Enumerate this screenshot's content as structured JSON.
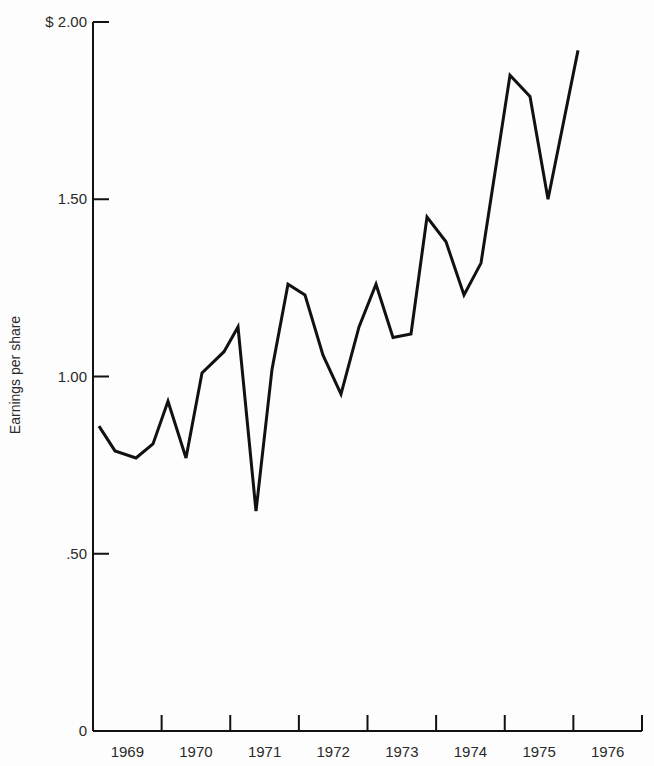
{
  "chart_data": {
    "type": "line",
    "title": "",
    "xlabel": "",
    "ylabel": "Earnings per share",
    "ylim": [
      0,
      2.0
    ],
    "y_ticks": [
      {
        "value": 0,
        "label": "0"
      },
      {
        "value": 0.5,
        "label": ".50"
      },
      {
        "value": 1.0,
        "label": "1.00"
      },
      {
        "value": 1.5,
        "label": "1.50"
      },
      {
        "value": 2.0,
        "label": "$ 2.00"
      }
    ],
    "x_ticks": [
      "1969",
      "1970",
      "1971",
      "1972",
      "1973",
      "1974",
      "1975",
      "1976"
    ],
    "grid": false,
    "legend": null,
    "series": [
      {
        "name": "Earnings per share (quarterly)",
        "x": [
          "1969 Q1",
          "1969 Q2",
          "1969 Q3",
          "1969 Q4",
          "1970 Q1",
          "1970 Q2",
          "1970 Q3",
          "1970 Q4",
          "1971 Q1",
          "1971 Q2",
          "1971 Q3",
          "1971 Q4",
          "1972 Q1",
          "1972 Q2",
          "1972 Q3",
          "1972 Q4",
          "1973 Q1",
          "1973 Q2",
          "1973 Q3",
          "1973 Q4",
          "1974 Q1",
          "1974 Q2",
          "1974 Q3",
          "1974 Q4",
          "1975 Q1",
          "1975 Q2",
          "1975 Q3"
        ],
        "values": [
          0.86,
          0.79,
          0.77,
          0.81,
          0.93,
          0.77,
          1.01,
          1.07,
          1.14,
          0.62,
          1.02,
          1.26,
          1.23,
          1.06,
          0.95,
          1.14,
          1.26,
          1.11,
          1.12,
          1.45,
          1.38,
          1.23,
          1.32,
          1.85,
          1.79,
          1.5,
          1.92
        ],
        "px": [
          99,
          115,
          136,
          153,
          168,
          186,
          202,
          224,
          238,
          256,
          272,
          288,
          305,
          323,
          341,
          359,
          376,
          393,
          411,
          427,
          446,
          464,
          481,
          510,
          530,
          548,
          578
        ]
      }
    ]
  }
}
